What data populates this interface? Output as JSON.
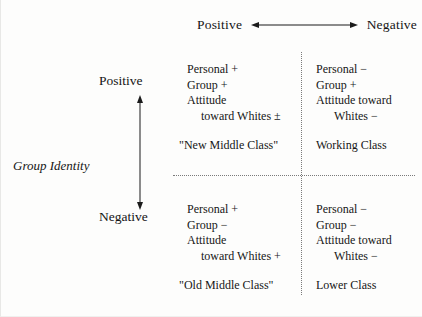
{
  "figure": {
    "horizontal_axis": {
      "left_label": "Positive",
      "right_label": "Negative",
      "arrow": "double-headed-horizontal-arrow"
    },
    "vertical_axis": {
      "title": "Group Identity",
      "top_label": "Positive",
      "bottom_label": "Negative",
      "arrow": "double-headed-vertical-arrow"
    },
    "quadrants": {
      "top_left": {
        "lines": [
          "Personal +",
          "Group +",
          "Attitude",
          "toward Whites ±"
        ],
        "class_name": "\"New Middle Class\""
      },
      "top_right": {
        "lines": [
          "Personal −",
          "Group +",
          "Attitude toward",
          "Whites −"
        ],
        "class_name": "Working Class"
      },
      "bottom_left": {
        "lines": [
          "Personal +",
          "Group −",
          "Attitude",
          "toward Whites +"
        ],
        "class_name": "\"Old Middle Class\""
      },
      "bottom_right": {
        "lines": [
          "Personal −",
          "Group −",
          "Attitude toward",
          "Whites −"
        ],
        "class_name": "Lower Class"
      }
    }
  }
}
